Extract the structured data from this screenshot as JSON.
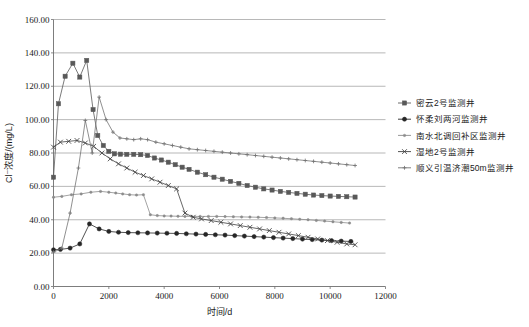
{
  "chart_data": {
    "type": "line",
    "title": "",
    "xlabel": "时间/d",
    "ylabel": "Cl⁻浓度/(mg/L)",
    "xlim": [
      0,
      12000
    ],
    "ylim": [
      0,
      160
    ],
    "xticks": [
      "0",
      "2000",
      "4000",
      "6000",
      "8000",
      "10000",
      "12000"
    ],
    "xtick_values": [
      0,
      2000,
      4000,
      6000,
      8000,
      10000,
      12000
    ],
    "yticks": [
      "0.00",
      "20.00",
      "40.00",
      "60.00",
      "80.00",
      "100.00",
      "120.00",
      "140.00",
      "160.00"
    ],
    "ytick_values": [
      0,
      20,
      40,
      60,
      80,
      100,
      120,
      140,
      160
    ],
    "grid": true,
    "legend_position": "right",
    "series": [
      {
        "name": "密云2号监测井",
        "marker": "square",
        "color": "#595959",
        "x": [
          0,
          180,
          420,
          700,
          950,
          1200,
          1430,
          1600,
          1800,
          2000,
          2200,
          2420,
          2650,
          2900,
          3150,
          3400,
          3650,
          3900,
          4150,
          4400,
          4650,
          4900,
          5200,
          5500,
          5800,
          6100,
          6400,
          6700,
          7000,
          7300,
          7600,
          7900,
          8200,
          8500,
          8800,
          9100,
          9400,
          9700,
          10000,
          10300,
          10600,
          10900
        ],
        "y": [
          65.5,
          109.5,
          126.0,
          133.8,
          125.5,
          135.5,
          106.0,
          90.5,
          84.5,
          81.0,
          79.5,
          79.3,
          79.2,
          79.2,
          79.0,
          78.5,
          77.0,
          75.8,
          74.5,
          73.0,
          71.5,
          70.2,
          68.5,
          67.0,
          65.5,
          64.3,
          63.0,
          61.8,
          60.5,
          59.5,
          58.5,
          57.8,
          57.0,
          56.4,
          55.8,
          55.3,
          54.8,
          54.5,
          54.2,
          54.0,
          53.8,
          53.6
        ]
      },
      {
        "name": "怀柔刘两河监测井",
        "marker": "circle",
        "color": "#262626",
        "x": [
          0,
          250,
          600,
          950,
          1300,
          1650,
          2000,
          2350,
          2700,
          3050,
          3400,
          3750,
          4100,
          4450,
          4800,
          5150,
          5500,
          5850,
          6200,
          6550,
          6900,
          7250,
          7600,
          7950,
          8300,
          8650,
          9000,
          9350,
          9700,
          10050,
          10400,
          10750
        ],
        "y": [
          22.0,
          22.2,
          23.0,
          25.5,
          37.5,
          34.5,
          33.0,
          32.5,
          32.3,
          32.2,
          32.1,
          32.0,
          31.9,
          31.8,
          31.6,
          31.4,
          31.2,
          31.0,
          30.8,
          30.5,
          30.2,
          29.9,
          29.6,
          29.3,
          29.0,
          28.7,
          28.4,
          28.1,
          27.8,
          27.5,
          27.2,
          27.0
        ]
      },
      {
        "name": "南水北调回补区监测井",
        "marker": "dot",
        "color": "#8c8c8c",
        "x": [
          0,
          300,
          650,
          1000,
          1350,
          1700,
          2000,
          2250,
          2500,
          2750,
          3000,
          3250,
          3500,
          3750,
          4000,
          4250,
          4500,
          4750,
          5000,
          5300,
          5600,
          5900,
          6200,
          6500,
          6800,
          7100,
          7400,
          7700,
          8000,
          8300,
          8600,
          8900,
          9200,
          9500,
          9800,
          10100,
          10400,
          10700
        ],
        "y": [
          53.5,
          54.0,
          55.0,
          55.5,
          56.5,
          57.0,
          56.5,
          56.0,
          55.5,
          55.0,
          54.8,
          55.0,
          43.0,
          42.5,
          42.3,
          42.2,
          42.1,
          42.0,
          42.0,
          42.0,
          42.0,
          42.0,
          41.9,
          41.8,
          41.7,
          41.6,
          41.5,
          41.3,
          41.1,
          40.9,
          40.6,
          40.3,
          40.0,
          39.6,
          39.2,
          38.8,
          38.4,
          38.0
        ]
      },
      {
        "name": "湿地2号监测井",
        "marker": "cross",
        "color": "#404040",
        "x": [
          0,
          250,
          550,
          850,
          1150,
          1450,
          1750,
          2050,
          2350,
          2650,
          2950,
          3250,
          3550,
          3850,
          4150,
          4450,
          4750,
          5050,
          5350,
          5700,
          6050,
          6400,
          6750,
          7100,
          7450,
          7800,
          8150,
          8500,
          8850,
          9200,
          9550,
          9900,
          10250,
          10600,
          10900
        ],
        "y": [
          83.5,
          86.5,
          87.0,
          87.5,
          86.0,
          84.0,
          80.0,
          76.5,
          73.5,
          71.0,
          68.5,
          66.5,
          64.5,
          62.5,
          60.5,
          58.5,
          44.0,
          41.5,
          40.5,
          39.5,
          38.5,
          37.5,
          36.5,
          35.5,
          34.5,
          33.5,
          32.5,
          31.5,
          30.5,
          29.5,
          28.5,
          27.5,
          26.5,
          25.5,
          25.0
        ]
      },
      {
        "name": "顺义引温济潮50m监测井",
        "marker": "plus",
        "color": "#737373",
        "x": [
          0,
          300,
          600,
          900,
          1150,
          1400,
          1650,
          1900,
          2150,
          2400,
          2650,
          2900,
          3150,
          3400,
          3700,
          4000,
          4300,
          4600,
          4900,
          5200,
          5500,
          5800,
          6100,
          6400,
          6700,
          7000,
          7300,
          7600,
          7900,
          8200,
          8500,
          8800,
          9100,
          9400,
          9700,
          10000,
          10300,
          10600,
          10900
        ],
        "y": [
          20.5,
          23.0,
          44.0,
          71.0,
          99.5,
          80.0,
          113.5,
          100.0,
          92.5,
          89.0,
          88.5,
          88.0,
          88.5,
          88.0,
          86.5,
          85.5,
          84.5,
          83.5,
          82.5,
          82.0,
          81.5,
          81.0,
          80.5,
          80.0,
          79.5,
          79.0,
          78.5,
          78.0,
          77.5,
          77.0,
          76.5,
          76.0,
          75.5,
          75.0,
          74.5,
          74.0,
          73.5,
          73.0,
          72.5
        ]
      }
    ]
  },
  "legend": {
    "items": [
      {
        "label": "密云2号监测井",
        "marker": "square",
        "color": "#595959"
      },
      {
        "label": "怀柔刘两河监测井",
        "marker": "circle",
        "color": "#262626"
      },
      {
        "label": "南水北调回补区监测井",
        "marker": "dot",
        "color": "#8c8c8c"
      },
      {
        "label": "湿地2号监测井",
        "marker": "cross",
        "color": "#404040"
      },
      {
        "label": "顺义引温济潮50m监测井",
        "marker": "plus",
        "color": "#737373"
      }
    ]
  }
}
